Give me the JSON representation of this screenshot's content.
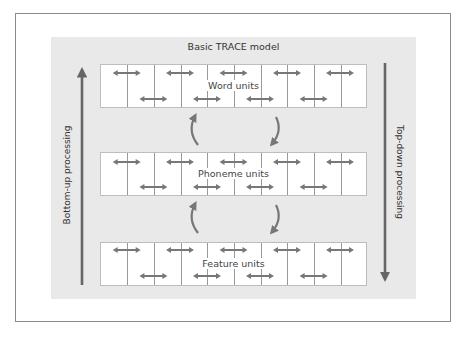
{
  "diagram": {
    "title": "Basic TRACE model",
    "left_axis": {
      "label": "Bottom-up processing",
      "direction": "up"
    },
    "right_axis": {
      "label": "Top-down processing",
      "direction": "down"
    },
    "layers": [
      {
        "id": "word",
        "label": "Word units",
        "columns": 10,
        "top_arrows": 5,
        "bottom_arrows": 4
      },
      {
        "id": "phoneme",
        "label": "Phoneme units",
        "columns": 10,
        "top_arrows": 5,
        "bottom_arrows": 4
      },
      {
        "id": "feature",
        "label": "Feature units",
        "columns": 10,
        "top_arrows": 5,
        "bottom_arrows": 4
      }
    ],
    "inter_layer_connections": [
      {
        "between": [
          "phoneme",
          "word"
        ],
        "arrows": [
          "phoneme-to-word (up)",
          "word-to-phoneme (down)"
        ]
      },
      {
        "between": [
          "feature",
          "phoneme"
        ],
        "arrows": [
          "feature-to-phoneme (up)",
          "phoneme-to-feature (down)"
        ]
      }
    ],
    "colors": {
      "panel": "#e9e9e9",
      "frame": "#8a8a8a",
      "arrow": "#777777",
      "axis_arrow": "#666666"
    }
  }
}
